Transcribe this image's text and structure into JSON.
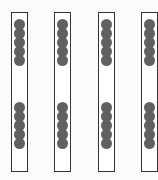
{
  "diagram": {
    "dot_color": "#606060",
    "border_color": "#333333",
    "rods": [
      {
        "index": 1,
        "left": 11,
        "top_group_count": 5,
        "bottom_group_count": 5,
        "total": 10
      },
      {
        "index": 2,
        "left": 54,
        "top_group_count": 5,
        "bottom_group_count": 5,
        "total": 10
      },
      {
        "index": 3,
        "left": 98,
        "top_group_count": 5,
        "bottom_group_count": 5,
        "total": 10
      },
      {
        "index": 4,
        "left": 141,
        "top_group_count": 5,
        "bottom_group_count": 5,
        "total": 10
      }
    ],
    "total_dots": 40
  }
}
